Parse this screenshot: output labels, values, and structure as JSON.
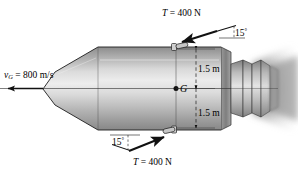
{
  "figure": {
    "body_fill_light": "#e8e8e8",
    "body_fill_mid": "#c8c8c8",
    "body_fill_dark": "#8f8f8f",
    "line_color": "#1a1a1a",
    "background": "#ffffff"
  },
  "labels": {
    "thrust_top": "T = 400 N",
    "thrust_top_symbol": "T",
    "thrust_top_value": " = 400 N",
    "angle_top": "15",
    "angle_top_unit": "°",
    "velocity_symbol": "v",
    "velocity_subscript": "G",
    "velocity_value": " = 800 m/s",
    "velocity_full": "v_G = 800 m/s",
    "dim_upper": "1.5 m",
    "dim_lower": "1.5 m",
    "center_of_mass": "G",
    "angle_bottom": "15",
    "angle_bottom_unit": "°",
    "thrust_bottom_symbol": "T",
    "thrust_bottom_value": " = 400 N",
    "thrust_bottom": "T = 400 N"
  },
  "icons": {
    "velocity_arrow": "arrow-left-icon",
    "thrust_arrow_top": "arrow-down-left-icon",
    "thrust_arrow_bottom": "arrow-up-right-icon",
    "nozzle_top": "thruster-nozzle-icon",
    "nozzle_bottom": "thruster-nozzle-icon",
    "exhaust": "exhaust-plume-icon",
    "centroid": "center-of-mass-dot-icon"
  },
  "physics": {
    "thrust_magnitude_n": 400,
    "thrust_angle_deg": 15,
    "velocity_m_per_s": 800,
    "moment_arm_upper_m": 1.5,
    "moment_arm_lower_m": 1.5
  }
}
